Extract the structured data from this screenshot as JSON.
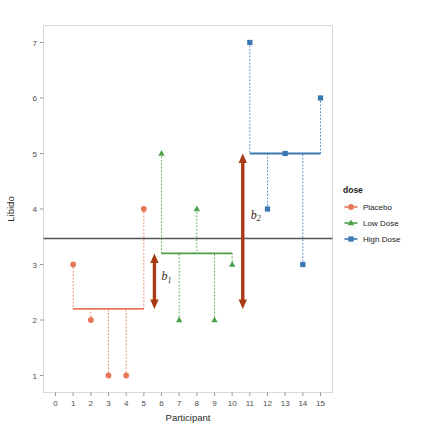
{
  "chart_data": {
    "type": "scatter",
    "title": "",
    "xlabel": "Participant",
    "ylabel": "Libido",
    "xlim": [
      0,
      15
    ],
    "ylim": [
      1,
      7
    ],
    "xticks": [
      "0",
      "1",
      "2",
      "3",
      "4",
      "5",
      "6",
      "7",
      "8",
      "9",
      "10",
      "11",
      "12",
      "13",
      "14",
      "15"
    ],
    "yticks": [
      "1",
      "2",
      "3",
      "4",
      "5",
      "6",
      "7"
    ],
    "grid": false,
    "legend": {
      "position": "right",
      "title": "dose",
      "entries": [
        {
          "label": "Placebo",
          "color": "#e8775a",
          "marker": "circle"
        },
        {
          "label": "Low Dose",
          "color": "#4aa14a",
          "marker": "triangle"
        },
        {
          "label": "High Dose",
          "color": "#3c78b4",
          "marker": "square"
        }
      ]
    },
    "series": [
      {
        "name": "Placebo",
        "color": "#e8775a",
        "marker": "circle",
        "group_mean": 2.2,
        "points": [
          {
            "x": 1,
            "y": 3
          },
          {
            "x": 2,
            "y": 2
          },
          {
            "x": 3,
            "y": 1
          },
          {
            "x": 4,
            "y": 1
          },
          {
            "x": 5,
            "y": 4
          }
        ]
      },
      {
        "name": "Low Dose",
        "color": "#4aa14a",
        "marker": "triangle",
        "group_mean": 3.2,
        "points": [
          {
            "x": 6,
            "y": 5
          },
          {
            "x": 7,
            "y": 2
          },
          {
            "x": 8,
            "y": 4
          },
          {
            "x": 9,
            "y": 2
          },
          {
            "x": 10,
            "y": 3
          }
        ]
      },
      {
        "name": "High Dose",
        "color": "#3c78b4",
        "marker": "square",
        "group_mean": 5.0,
        "points": [
          {
            "x": 11,
            "y": 7
          },
          {
            "x": 12,
            "y": 4
          },
          {
            "x": 13,
            "y": 5
          },
          {
            "x": 14,
            "y": 3
          },
          {
            "x": 15,
            "y": 6
          }
        ]
      }
    ],
    "grand_mean": {
      "value": 3.467,
      "color": "#555555"
    },
    "annotations": [
      {
        "id": "b1",
        "label": "b",
        "subscript": "1",
        "x": 5.6,
        "y_from": 2.2,
        "y_to": 3.2,
        "color": "#a83a16",
        "label_x": 6.0,
        "label_y": 2.72
      },
      {
        "id": "b2",
        "label": "b",
        "subscript": "2",
        "x": 10.6,
        "y_from": 2.2,
        "y_to": 5.0,
        "color": "#a83a16",
        "label_x": 11.05,
        "label_y": 3.82
      }
    ]
  },
  "colors": {
    "placebo": "#e8775a",
    "low_dose": "#4aa14a",
    "high_dose": "#3c78b4",
    "grand_mean": "#555555",
    "annotation": "#a83a16",
    "panel_border": "#d9d9d9",
    "axis_text": "#4d4d4d"
  }
}
